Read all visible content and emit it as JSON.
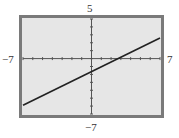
{
  "chart_data": {
    "type": "line",
    "title": "",
    "xlabel": "",
    "ylabel": "",
    "xlim": [
      -7,
      7
    ],
    "ylim": [
      -7,
      5
    ],
    "x_tick_step": 1,
    "y_tick_step": 1,
    "grid": false,
    "series": [
      {
        "name": "line",
        "x": [
          -7,
          7
        ],
        "y": [
          -5.9,
          2.6
        ]
      }
    ],
    "tick_labels": {
      "x_min": "−7",
      "x_max": "7",
      "y_min": "−7",
      "y_max": "5"
    }
  },
  "colors": {
    "frame": "#7a7a7a",
    "background": "#e6e6e6",
    "line": "#222222",
    "axis": "#555555"
  }
}
